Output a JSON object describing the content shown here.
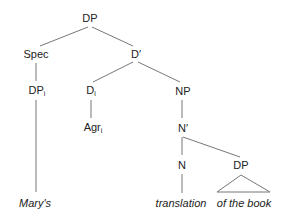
{
  "diagram": {
    "type": "syntax-tree",
    "nodes": {
      "dp_root": {
        "label": "DP",
        "sub": ""
      },
      "spec": {
        "label": "Spec",
        "sub": ""
      },
      "d_bar": {
        "label": "D′",
        "sub": ""
      },
      "dp_i": {
        "label": "DP",
        "sub": "i"
      },
      "d_i": {
        "label": "D",
        "sub": "i"
      },
      "np": {
        "label": "NP",
        "sub": ""
      },
      "agr_i": {
        "label": "Agr",
        "sub": "i"
      },
      "n_bar": {
        "label": "N′",
        "sub": ""
      },
      "n": {
        "label": "N",
        "sub": ""
      },
      "dp_obj": {
        "label": "DP",
        "sub": ""
      }
    },
    "leaves": {
      "marys": "Mary's",
      "translation": "translation",
      "of_the_book": "of the book"
    },
    "edges": [
      [
        "DP",
        "Spec"
      ],
      [
        "DP",
        "D′"
      ],
      [
        "Spec",
        "DPi"
      ],
      [
        "D′",
        "Di"
      ],
      [
        "D′",
        "NP"
      ],
      [
        "DPi",
        "Mary's"
      ],
      [
        "Di",
        "Agri"
      ],
      [
        "NP",
        "N′"
      ],
      [
        "N′",
        "N"
      ],
      [
        "N′",
        "DP"
      ],
      [
        "N",
        "translation"
      ],
      [
        "DP",
        "of the book (triangle)"
      ]
    ],
    "line_color": "#777777"
  }
}
